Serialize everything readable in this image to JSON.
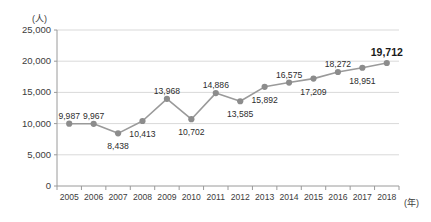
{
  "chart_data": {
    "type": "line",
    "title": "",
    "xlabel": "(年)",
    "ylabel": "(人)",
    "categories": [
      "2005",
      "2006",
      "2007",
      "2008",
      "2009",
      "2010",
      "2011",
      "2012",
      "2013",
      "2014",
      "2015",
      "2016",
      "2017",
      "2018"
    ],
    "values": [
      9987,
      9967,
      8438,
      10413,
      13968,
      10702,
      14886,
      13585,
      15892,
      16575,
      17209,
      18272,
      18951,
      19712
    ],
    "point_labels": [
      "9,987",
      "9,967",
      "8,438",
      "10,413",
      "13,968",
      "10,702",
      "14,886",
      "13,585",
      "15,892",
      "16,575",
      "17,209",
      "18,272",
      "18,951",
      "19,712"
    ],
    "label_positions": [
      "above",
      "above",
      "below",
      "below",
      "above",
      "below",
      "above",
      "below",
      "below",
      "above",
      "below",
      "above",
      "below",
      "above"
    ],
    "emphasized_index": 13,
    "ylim": [
      0,
      25000
    ],
    "ytick_values": [
      0,
      5000,
      10000,
      15000,
      20000,
      25000
    ],
    "ytick_labels": [
      "0",
      "5,000",
      "10,000",
      "15,000",
      "20,000",
      "25,000"
    ],
    "grid": true,
    "legend": "none",
    "series_color": "#9a9a9a",
    "marker_color": "#8c8c8c",
    "grid_color": "#d9d9d9",
    "axis_color": "#9a9a9a"
  },
  "axes": {
    "y_unit": "(人)",
    "x_unit": "(年)"
  }
}
